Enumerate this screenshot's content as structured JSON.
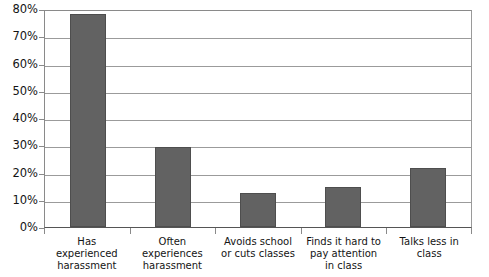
{
  "chart_data": {
    "type": "bar",
    "title": "",
    "subtitle": "",
    "xlabel": "",
    "ylabel": "",
    "ylim": [
      0,
      80
    ],
    "ytick_step": 10,
    "ytick_labels": [
      "80%",
      "70%",
      "60%",
      "50%",
      "40%",
      "30%",
      "20%",
      "10%",
      "0%"
    ],
    "ytick_values": [
      80,
      70,
      60,
      50,
      40,
      30,
      20,
      10,
      0
    ],
    "grid": true,
    "legend": null,
    "categories": [
      "Has experienced harassment",
      "Often experiences harassment",
      "Avoids school or cuts classes",
      "Finds it hard to pay attention in class",
      "Talks less in class"
    ],
    "category_lines": [
      [
        "Has",
        "experienced",
        "harassment"
      ],
      [
        "Often",
        "experiences",
        "harassment"
      ],
      [
        "Avoids school",
        "or cuts classes"
      ],
      [
        "Finds it hard to",
        "pay attention",
        "in class"
      ],
      [
        "Talks less in",
        "class"
      ]
    ],
    "values": [
      79,
      29.5,
      12.5,
      15,
      22
    ],
    "value_unit": "%",
    "bar_color": "#626262",
    "bar_border_color": "#4e4e4e",
    "gridline_color": "#9b9b9b",
    "axis_color": "#8a8a8a",
    "text_color": "#141414",
    "background": "#ffffff"
  }
}
